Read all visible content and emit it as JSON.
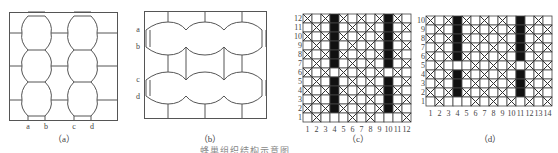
{
  "figure": {
    "panels": [
      {
        "id": "a",
        "caption": "（a）",
        "type": "hexagon-mesh-vertical",
        "edge_labels": [
          "a",
          "b",
          "c",
          "d"
        ]
      },
      {
        "id": "b",
        "caption": "（b）",
        "type": "hexagon-mesh-horizontal",
        "edge_labels": [
          "a",
          "b",
          "c",
          "d"
        ]
      },
      {
        "id": "c",
        "caption": "（c）",
        "type": "weave-grid",
        "columns": 12,
        "rows": 12,
        "col_labels": [
          "1",
          "2",
          "3",
          "4",
          "5",
          "6",
          "7",
          "8",
          "9",
          "10",
          "11",
          "12"
        ],
        "row_labels": [
          "12",
          "11",
          "10",
          "9",
          "8",
          "7",
          "6",
          "5",
          "4",
          "3",
          "2",
          "1"
        ],
        "black_columns": [
          4,
          10
        ]
      },
      {
        "id": "d",
        "caption": "（d）",
        "type": "weave-grid",
        "columns": 14,
        "rows": 10,
        "col_labels": [
          "1",
          "2",
          "3",
          "4",
          "5",
          "6",
          "7",
          "8",
          "9",
          "10",
          "11",
          "12",
          "13",
          "14"
        ],
        "row_labels": [
          "10",
          "9",
          "8",
          "7",
          "6",
          "5",
          "4",
          "3",
          "2",
          "1"
        ],
        "black_columns": [
          4,
          11
        ]
      }
    ],
    "footer_caption": "蜂巢组织结构示意图"
  }
}
